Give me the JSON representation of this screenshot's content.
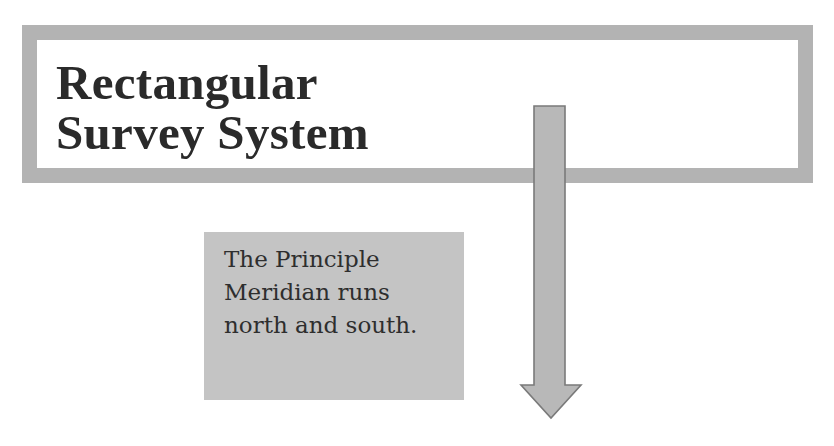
{
  "slide": {
    "title_lines": [
      "Rectangular",
      "Survey System"
    ],
    "callout_lines": [
      "The Principle",
      "Meridian runs",
      "north and south."
    ],
    "arrow": {
      "direction": "down",
      "icon": "down-arrow-icon"
    },
    "colors": {
      "frame_border": "#b3b3b3",
      "callout_fill": "#c4c4c4",
      "arrow_fill": "#b8b8b8",
      "arrow_outline": "#7a7a7a",
      "text": "#2a2a2a",
      "background": "#ffffff"
    }
  }
}
